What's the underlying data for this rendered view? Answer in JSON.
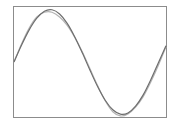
{
  "chart_data": {
    "type": "line",
    "title": "",
    "xlabel": "",
    "ylabel": "",
    "grid": false,
    "legend": null,
    "xlim": [
      0,
      6.6
    ],
    "ylim": [
      -1.05,
      1.05
    ],
    "x": [
      0,
      0.33,
      0.66,
      0.99,
      1.32,
      1.65,
      1.98,
      2.31,
      2.64,
      2.97,
      3.3,
      3.63,
      3.96,
      4.29,
      4.62,
      4.95,
      5.28,
      5.61,
      5.94,
      6.27,
      6.6
    ],
    "series": [
      {
        "name": "sin(x)",
        "color": "#6e6e6e",
        "values": [
          0,
          0.324,
          0.613,
          0.836,
          0.969,
          0.997,
          0.917,
          0.738,
          0.479,
          0.17,
          -0.158,
          -0.469,
          -0.73,
          -0.912,
          -0.996,
          -0.972,
          -0.842,
          -0.628,
          -0.339,
          -0.013,
          0.312
        ]
      },
      {
        "name": "approximation",
        "color": "#b4b4b4",
        "values": [
          0,
          0.35,
          0.65,
          0.86,
          0.95,
          0.95,
          0.86,
          0.7,
          0.47,
          0.19,
          -0.13,
          -0.45,
          -0.74,
          -0.95,
          -1.03,
          -0.99,
          -0.86,
          -0.66,
          -0.38,
          -0.06,
          0.29
        ]
      }
    ]
  },
  "colors": {
    "frame": "#8c8c8c",
    "background": "#ffffff"
  }
}
